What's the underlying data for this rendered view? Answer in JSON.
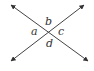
{
  "diagram": {
    "type": "intersecting-lines",
    "line_color": "#444444",
    "intersection": {
      "x": 48,
      "y": 32
    },
    "lines": [
      {
        "name": "line-1",
        "from": {
          "x": 11,
          "y": 5
        },
        "to": {
          "x": 88,
          "y": 61
        }
      },
      {
        "name": "line-2",
        "from": {
          "x": 84,
          "y": 5
        },
        "to": {
          "x": 11,
          "y": 61
        }
      }
    ],
    "angle_labels": {
      "a": "a",
      "b": "b",
      "c": "c",
      "d": "d"
    }
  }
}
